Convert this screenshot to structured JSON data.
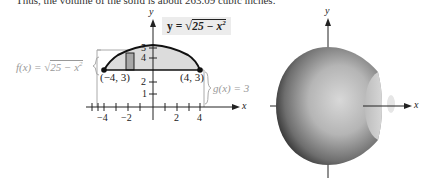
{
  "text": {
    "top_line": "Thus, the volume of the solid is about 263.09 cubic inches."
  },
  "left_figure": {
    "equation_box": "y = √(25 − x²)",
    "equation_parts": {
      "lhs": "y = ",
      "radicand": "25 − x",
      "exp": "2"
    },
    "f_label": {
      "name": "f(x) = ",
      "radicand": "25 − x",
      "exp": "2"
    },
    "g_label": "g(x) = 3",
    "point_left": "(−4, 3)",
    "point_right": "(4, 3)",
    "axis_x_label": "x",
    "axis_y_label": "y",
    "x_ticks": [
      "−4",
      "−2",
      "2",
      "4"
    ],
    "y_ticks": [
      "1",
      "2",
      "4",
      "5"
    ]
  },
  "right_figure": {
    "axis_x_label": "x",
    "axis_y_label": "y",
    "description": "solid of revolution (sphere-like with flattened ends)"
  },
  "colors": {
    "region_fill": "#dcdcdc",
    "rect_fill": "#a8a8a8",
    "curve": "#111111",
    "bracket": "#aaaaaa"
  }
}
